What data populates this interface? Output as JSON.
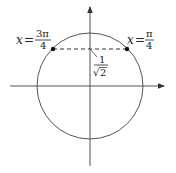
{
  "diagram": {
    "type": "unit-circle",
    "center": [
      90,
      86
    ],
    "radius": 53,
    "axes": {
      "horizontal": {
        "from": [
          10,
          86
        ],
        "to": [
          165,
          86
        ],
        "arrow": "right"
      },
      "vertical": {
        "from": [
          90,
          166
        ],
        "to": [
          90,
          6
        ],
        "arrow": "up"
      }
    },
    "points": [
      {
        "name": "point-3pi-4",
        "x": 53,
        "y": 49
      },
      {
        "name": "point-pi-4",
        "x": 127,
        "y": 49
      }
    ],
    "dashed_chord": {
      "from": [
        53,
        49
      ],
      "to": [
        127,
        49
      ]
    },
    "colors": {
      "stroke": "#444444",
      "text": "#222222",
      "point": "#111111"
    }
  },
  "labels": {
    "left": {
      "var": "x",
      "eq": "=",
      "num": "3π",
      "den": "4"
    },
    "right": {
      "var": "x",
      "eq": "=",
      "num": "π",
      "den": "4"
    },
    "height": {
      "num": "1",
      "den": "2",
      "radical": "√"
    }
  }
}
